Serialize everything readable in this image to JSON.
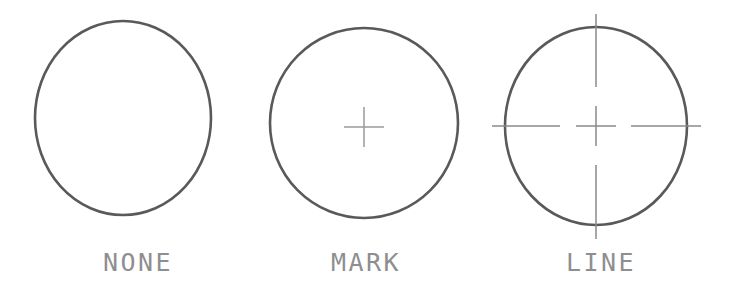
{
  "canvas": {
    "width": 741,
    "height": 296,
    "background": "#ffffff"
  },
  "style": {
    "circle_stroke": "#59595b",
    "circle_stroke_width": 2.6,
    "mark_stroke": "#9a9a9c",
    "line_stroke": "#8a8a8c",
    "mark_stroke_width": 1.5,
    "label_color": "#8e8e90",
    "label_font_size": 25
  },
  "diagram": {
    "panels": [
      {
        "id": "none",
        "label": "NONE",
        "center_mark_type": "none",
        "circle": {
          "cx": 123,
          "cy": 118,
          "rx": 88,
          "ry": 97
        },
        "label_pos": {
          "x": 138,
          "y": 271
        }
      },
      {
        "id": "mark",
        "label": "MARK",
        "center_mark_type": "mark",
        "circle": {
          "cx": 364,
          "cy": 123,
          "rx": 94,
          "ry": 95
        },
        "cross": {
          "cx": 364,
          "cy": 127,
          "arm": 20
        },
        "label_pos": {
          "x": 366,
          "y": 271
        }
      },
      {
        "id": "line",
        "label": "LINE",
        "center_mark_type": "line",
        "circle": {
          "cx": 596,
          "cy": 126,
          "rx": 91,
          "ry": 99
        },
        "cross": {
          "cx": 596,
          "cy": 126,
          "arm": 20
        },
        "centerlines": {
          "h_left": {
            "x1": 492,
            "x2": 560,
            "y": 126
          },
          "h_right": {
            "x1": 631,
            "x2": 701,
            "y": 126
          },
          "v_top": {
            "y1": 14,
            "y2": 87,
            "x": 596
          },
          "v_bottom": {
            "y1": 165,
            "y2": 239,
            "x": 596
          }
        },
        "label_pos": {
          "x": 601,
          "y": 271
        }
      }
    ]
  }
}
